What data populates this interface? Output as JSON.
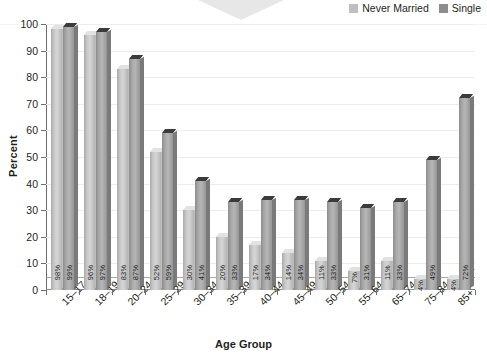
{
  "chart_data": {
    "type": "bar",
    "title": "",
    "xlabel": "Age Group",
    "ylabel": "Percent",
    "ylim": [
      0,
      100
    ],
    "yticks": [
      0,
      10,
      20,
      30,
      40,
      50,
      60,
      70,
      80,
      90,
      100
    ],
    "grid": true,
    "legend_position": "top-right",
    "categories": [
      "15–17",
      "18–19",
      "20–24",
      "25–29",
      "30–34",
      "35–39",
      "40–44",
      "45–49",
      "50–54",
      "55–64",
      "65–74",
      "75–84",
      "85+"
    ],
    "series": [
      {
        "name": "Never Married",
        "color": "#bfbfbf",
        "values": [
          98,
          96,
          83,
          52,
          30,
          20,
          17,
          14,
          11,
          7,
          11,
          4,
          4
        ],
        "labels": [
          "98%",
          "96%",
          "83%",
          "52%",
          "30%",
          "20%",
          "17%",
          "14%",
          "11%",
          "7%",
          "11%",
          "4%",
          "4%"
        ]
      },
      {
        "name": "Single",
        "color": "#8d8d8d",
        "values": [
          99,
          97,
          87,
          59,
          41,
          33,
          34,
          34,
          33,
          31,
          33,
          49,
          72
        ],
        "labels": [
          "99%",
          "97%",
          "87%",
          "59%",
          "41%",
          "33%",
          "34%",
          "34%",
          "33%",
          "31%",
          "33%",
          "49%",
          "72%"
        ]
      }
    ],
    "reference_line": 5
  },
  "legend": {
    "items": [
      {
        "label": "Never Married",
        "swatch": "never-married-swatch"
      },
      {
        "label": "Single",
        "swatch": "single-swatch"
      }
    ]
  },
  "axes": {
    "y_title": "Percent",
    "x_title": "Age Group"
  }
}
